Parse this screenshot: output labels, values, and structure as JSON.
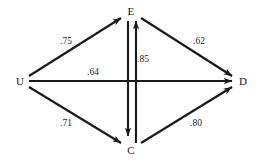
{
  "diagram": {
    "type": "path-diagram",
    "background_color": "#ffffff",
    "line_color": "#1a1a1a",
    "nodes": [
      {
        "id": "U",
        "label": "U",
        "x": 20,
        "y": 81
      },
      {
        "id": "E",
        "label": "E",
        "x": 131,
        "y": 11
      },
      {
        "id": "D",
        "label": "D",
        "x": 243,
        "y": 81
      },
      {
        "id": "C",
        "label": "C",
        "x": 131,
        "y": 150
      }
    ],
    "edges": [
      {
        "id": "U-E",
        "from": "U",
        "to": "E",
        "label": ".75",
        "label_x": 66,
        "label_y": 42,
        "arrow": "single"
      },
      {
        "id": "E-D",
        "from": "E",
        "to": "D",
        "label": ".62",
        "label_x": 199,
        "label_y": 42,
        "arrow": "single"
      },
      {
        "id": "U-D",
        "from": "U",
        "to": "D",
        "label": ".64",
        "label_x": 93,
        "label_y": 73,
        "arrow": "single"
      },
      {
        "id": "U-C",
        "from": "U",
        "to": "C",
        "label": ".71",
        "label_x": 66,
        "label_y": 124,
        "arrow": "single"
      },
      {
        "id": "C-D",
        "from": "C",
        "to": "D",
        "label": ".80",
        "label_x": 196,
        "label_y": 124,
        "arrow": "single"
      },
      {
        "id": "E-C",
        "from": "E",
        "to": "C",
        "label": ".85",
        "label_x": 143,
        "label_y": 60,
        "arrow": "double"
      }
    ]
  }
}
